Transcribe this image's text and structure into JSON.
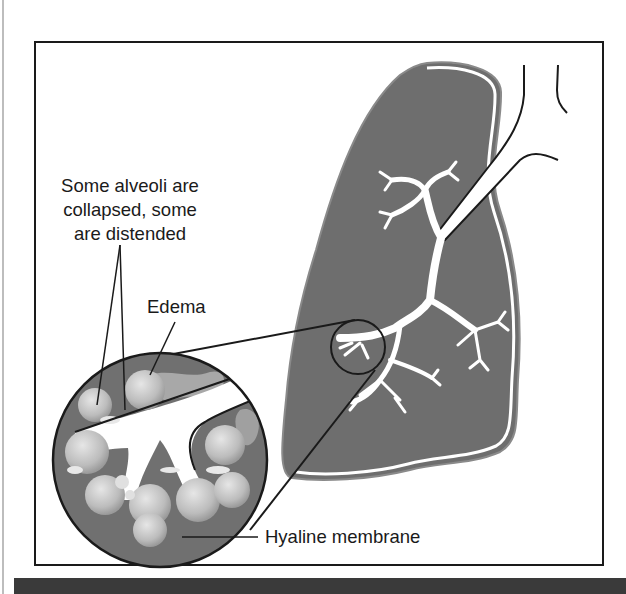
{
  "figure": {
    "colors": {
      "lung_fill": "#6e6e6e",
      "frame": "#1a1a1a",
      "bottom_bar": "#3a3a3a",
      "alveoli": "#c8c8c8",
      "airway": "#ffffff"
    },
    "labels": {
      "alveoli_line1": "Some alveoli are",
      "alveoli_line2": "collapsed, some",
      "alveoli_line3": "are distended",
      "edema": "Edema",
      "hyaline": "Hyaline membrane"
    }
  }
}
